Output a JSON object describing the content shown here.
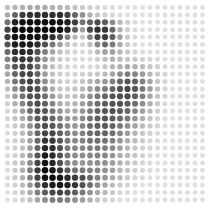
{
  "figure": {
    "background_color": "#ffffff",
    "width": 215,
    "height": 208
  },
  "chart_data": {
    "type": "heatmap",
    "subtitle": "",
    "xlabel": "",
    "ylabel": "",
    "legend": [],
    "grid": false,
    "marker": "circle",
    "encoding": "darkness",
    "value_range": [
      0,
      100
    ],
    "value_meaning": "0 = white (empty), 100 = black (full intensity)",
    "palette": {
      "min_color": "#ffffff",
      "max_color": "#000000"
    },
    "geometry": {
      "rows": 27,
      "cols": 27,
      "origin_x": 7.5,
      "origin_y": 7.5,
      "pitch_x": 7.5,
      "pitch_y": 7.4,
      "dot_max_diameter": 6.6,
      "dot_min_diameter": 4.2
    },
    "x": [
      1,
      2,
      3,
      4,
      5,
      6,
      7,
      8,
      9,
      10,
      11,
      12,
      13,
      14,
      15,
      16,
      17,
      18,
      19,
      20,
      21,
      22,
      23,
      24,
      25,
      26,
      27
    ],
    "y": [
      1,
      2,
      3,
      4,
      5,
      6,
      7,
      8,
      9,
      10,
      11,
      12,
      13,
      14,
      15,
      16,
      17,
      18,
      19,
      20,
      21,
      22,
      23,
      24,
      25,
      26,
      27
    ],
    "values": [
      [
        22,
        26,
        28,
        30,
        30,
        30,
        28,
        26,
        24,
        20,
        18,
        16,
        14,
        12,
        12,
        10,
        10,
        10,
        10,
        10,
        10,
        10,
        10,
        10,
        10,
        10,
        10
      ],
      [
        30,
        58,
        74,
        78,
        80,
        80,
        80,
        80,
        72,
        58,
        40,
        28,
        20,
        16,
        14,
        12,
        10,
        10,
        10,
        10,
        10,
        10,
        10,
        10,
        10,
        10,
        10
      ],
      [
        52,
        86,
        92,
        94,
        94,
        94,
        94,
        92,
        86,
        74,
        52,
        60,
        68,
        62,
        42,
        24,
        16,
        12,
        10,
        10,
        10,
        10,
        10,
        10,
        10,
        10,
        10
      ],
      [
        72,
        94,
        96,
        96,
        96,
        96,
        96,
        94,
        84,
        60,
        34,
        70,
        80,
        76,
        56,
        28,
        16,
        12,
        10,
        10,
        10,
        10,
        10,
        10,
        10,
        10,
        10
      ],
      [
        74,
        92,
        94,
        94,
        92,
        88,
        80,
        66,
        46,
        26,
        18,
        46,
        72,
        74,
        60,
        34,
        18,
        12,
        10,
        10,
        10,
        10,
        10,
        10,
        10,
        10,
        10
      ],
      [
        66,
        88,
        90,
        88,
        80,
        66,
        50,
        34,
        22,
        16,
        14,
        22,
        44,
        56,
        48,
        30,
        18,
        12,
        10,
        10,
        10,
        10,
        10,
        10,
        10,
        10,
        10
      ],
      [
        56,
        80,
        84,
        80,
        66,
        48,
        32,
        22,
        16,
        14,
        12,
        14,
        24,
        34,
        34,
        26,
        18,
        14,
        12,
        10,
        10,
        10,
        10,
        10,
        10,
        10,
        10
      ],
      [
        46,
        72,
        78,
        74,
        58,
        38,
        24,
        18,
        14,
        12,
        12,
        12,
        16,
        22,
        26,
        24,
        20,
        18,
        16,
        14,
        12,
        10,
        10,
        10,
        10,
        10,
        10
      ],
      [
        38,
        64,
        72,
        70,
        54,
        34,
        22,
        16,
        14,
        12,
        12,
        12,
        14,
        18,
        24,
        28,
        30,
        28,
        24,
        20,
        16,
        12,
        10,
        10,
        10,
        10,
        10
      ],
      [
        32,
        58,
        70,
        72,
        58,
        36,
        22,
        16,
        14,
        14,
        16,
        18,
        20,
        24,
        32,
        42,
        48,
        46,
        36,
        26,
        18,
        14,
        10,
        10,
        10,
        10,
        10
      ],
      [
        26,
        50,
        66,
        72,
        62,
        42,
        26,
        18,
        16,
        16,
        20,
        26,
        32,
        38,
        46,
        58,
        64,
        60,
        46,
        32,
        20,
        14,
        10,
        10,
        10,
        10,
        10
      ],
      [
        22,
        42,
        60,
        70,
        66,
        48,
        30,
        20,
        18,
        20,
        26,
        34,
        42,
        50,
        58,
        66,
        70,
        64,
        50,
        34,
        22,
        14,
        10,
        10,
        10,
        10,
        10
      ],
      [
        18,
        34,
        52,
        66,
        68,
        54,
        36,
        24,
        20,
        22,
        30,
        40,
        50,
        58,
        64,
        68,
        68,
        60,
        46,
        32,
        20,
        14,
        10,
        10,
        10,
        10,
        10
      ],
      [
        16,
        28,
        44,
        60,
        68,
        60,
        44,
        30,
        24,
        26,
        34,
        44,
        54,
        62,
        66,
        66,
        62,
        54,
        40,
        28,
        18,
        12,
        10,
        10,
        10,
        10,
        10
      ],
      [
        14,
        22,
        36,
        54,
        66,
        64,
        52,
        38,
        30,
        30,
        38,
        48,
        58,
        64,
        66,
        62,
        56,
        46,
        34,
        24,
        16,
        12,
        10,
        10,
        10,
        10,
        10
      ],
      [
        14,
        20,
        30,
        46,
        62,
        66,
        58,
        46,
        36,
        34,
        42,
        52,
        60,
        64,
        62,
        56,
        48,
        38,
        28,
        20,
        14,
        12,
        10,
        10,
        10,
        10,
        10
      ],
      [
        12,
        18,
        26,
        40,
        58,
        68,
        64,
        54,
        42,
        38,
        44,
        54,
        60,
        62,
        58,
        50,
        40,
        32,
        24,
        18,
        14,
        10,
        10,
        10,
        10,
        10,
        10
      ],
      [
        12,
        16,
        24,
        36,
        56,
        72,
        70,
        60,
        48,
        42,
        46,
        54,
        58,
        58,
        52,
        44,
        34,
        26,
        20,
        16,
        12,
        10,
        10,
        10,
        10,
        10,
        10
      ],
      [
        12,
        16,
        22,
        34,
        56,
        78,
        76,
        64,
        50,
        44,
        46,
        52,
        54,
        52,
        46,
        38,
        30,
        24,
        18,
        14,
        12,
        10,
        10,
        10,
        10,
        10,
        10
      ],
      [
        12,
        16,
        22,
        34,
        58,
        84,
        80,
        66,
        50,
        44,
        44,
        48,
        50,
        48,
        42,
        34,
        26,
        20,
        16,
        14,
        12,
        10,
        10,
        10,
        10,
        10,
        10
      ],
      [
        12,
        16,
        24,
        38,
        64,
        88,
        82,
        66,
        50,
        42,
        42,
        44,
        46,
        44,
        38,
        30,
        24,
        20,
        16,
        12,
        10,
        10,
        10,
        10,
        10,
        10,
        10
      ],
      [
        12,
        18,
        26,
        42,
        70,
        92,
        84,
        66,
        48,
        40,
        38,
        40,
        42,
        40,
        34,
        28,
        22,
        18,
        14,
        12,
        10,
        10,
        10,
        10,
        10,
        10,
        10
      ],
      [
        12,
        18,
        28,
        48,
        76,
        94,
        90,
        78,
        62,
        52,
        48,
        46,
        44,
        40,
        34,
        26,
        20,
        16,
        14,
        12,
        10,
        10,
        10,
        10,
        10,
        10,
        10
      ],
      [
        12,
        18,
        28,
        46,
        72,
        92,
        94,
        90,
        82,
        74,
        66,
        56,
        46,
        38,
        30,
        24,
        18,
        14,
        12,
        10,
        10,
        10,
        10,
        10,
        10,
        10,
        10
      ],
      [
        12,
        16,
        24,
        38,
        60,
        80,
        88,
        90,
        86,
        78,
        66,
        54,
        42,
        32,
        24,
        18,
        14,
        12,
        10,
        10,
        10,
        10,
        10,
        10,
        10,
        10,
        10
      ],
      [
        10,
        14,
        20,
        30,
        46,
        62,
        70,
        72,
        68,
        60,
        50,
        40,
        30,
        24,
        18,
        14,
        12,
        10,
        10,
        10,
        10,
        10,
        10,
        10,
        10,
        10,
        10
      ],
      [
        10,
        12,
        16,
        22,
        32,
        42,
        48,
        50,
        46,
        40,
        34,
        28,
        22,
        16,
        14,
        12,
        10,
        10,
        10,
        10,
        10,
        10,
        10,
        10,
        10,
        10,
        10
      ]
    ]
  }
}
